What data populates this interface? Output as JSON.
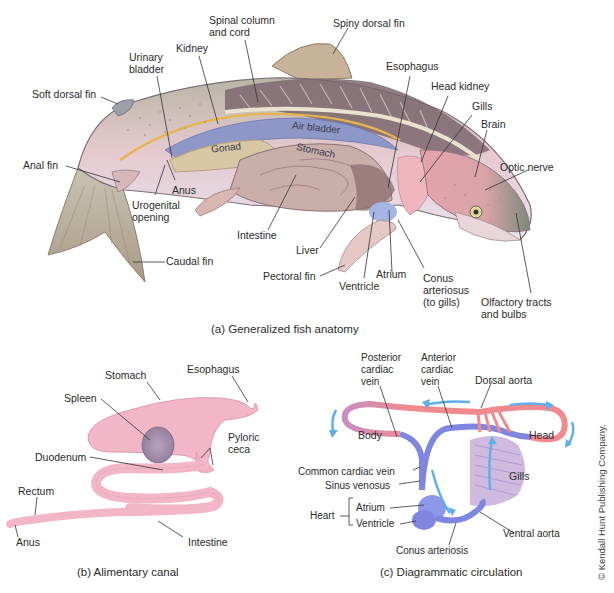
{
  "figure_a": {
    "caption": "(a) Generalized fish anatomy",
    "labels": {
      "spinal_column": "Spinal column\nand cord",
      "spiny_dorsal_fin": "Spiny dorsal fin",
      "urinary_bladder": "Urinary\nbladder",
      "kidney": "Kidney",
      "esophagus": "Esophagus",
      "head_kidney": "Head kidney",
      "soft_dorsal_fin": "Soft dorsal fin",
      "gills": "Gills",
      "brain": "Brain",
      "air_bladder": "Air bladder",
      "gonad": "Gonad",
      "stomach": "Stomach",
      "optic_nerve": "Optic nerve",
      "anal_fin": "Anal fin",
      "anus": "Anus",
      "urogenital_opening": "Urogenital\nopening",
      "intestine": "Intestine",
      "liver": "Liver",
      "caudal_fin": "Caudal fin",
      "pectoral_fin": "Pectoral fin",
      "atrium": "Atrium",
      "ventricle": "Ventricle",
      "conus_arteriosus": "Conus\narteriosus\n(to gills)",
      "olfactory": "Olfactory tracts\nand bulbs"
    }
  },
  "figure_b": {
    "caption": "(b) Alimentary canal",
    "labels": {
      "stomach": "Stomach",
      "esophagus": "Esophagus",
      "spleen": "Spleen",
      "pyloric_ceca": "Pyloric\nceca",
      "duodenum": "Duodenum",
      "rectum": "Rectum",
      "anus": "Anus",
      "intestine": "Intestine"
    }
  },
  "figure_c": {
    "caption": "(c) Diagrammatic circulation",
    "labels": {
      "posterior_cardiac_vein": "Posterior\ncardiac\nvein",
      "anterior_cardiac_vein": "Anterior\ncardiac\nvein",
      "dorsal_aorta": "Dorsal aorta",
      "body": "Body",
      "head": "Head",
      "common_cardiac_vein": "Common cardiac vein",
      "sinus_venosus": "Sinus venosus",
      "gills": "Gills",
      "heart": "Heart",
      "atrium": "Atrium",
      "ventricle": "Ventricle",
      "ventral_aorta": "Ventral aorta",
      "conus_arteriosis": "Conus arteriosis"
    }
  },
  "copyright": "© Kendall Hunt Publishing Company.",
  "colors": {
    "artery_red": "#f08a8f",
    "vein_blue": "#7f86e0",
    "flow_arrow": "#5fb0ea",
    "gut_pink": "#f2b6c6",
    "fish_back": "#7e6770",
    "fish_belly": "#ddd9e6",
    "air_bladder": "#8e98c8"
  }
}
